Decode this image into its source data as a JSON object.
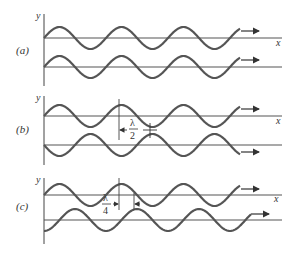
{
  "panels": [
    {
      "id": "a",
      "label": "(a)",
      "y_axis_label": "y",
      "x_axis_label": "x",
      "description": "Two waves in phase",
      "phase_shift": "0"
    },
    {
      "id": "b",
      "label": "(b)",
      "y_axis_label": "y",
      "x_axis_label": "x",
      "description": "Two waves out of phase by half a wavelength",
      "phase_shift": "λ/2",
      "annotation": {
        "numerator": "λ",
        "denominator": "2"
      }
    },
    {
      "id": "c",
      "label": "(c)",
      "y_axis_label": "y",
      "x_axis_label": "x",
      "description": "Two waves out of phase by a quarter wavelength",
      "phase_shift": "λ/4",
      "annotation": {
        "numerator": "λ",
        "denominator": "4"
      }
    }
  ],
  "colors": {
    "wave": "#555555",
    "axis": "#444444",
    "text": "#333333"
  }
}
